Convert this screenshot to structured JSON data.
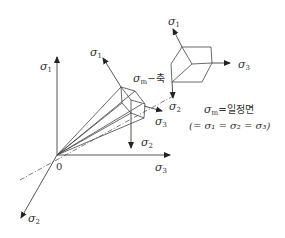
{
  "diagram": {
    "axes": {
      "sigma1": {
        "symbol": "σ",
        "sub": "1"
      },
      "sigma2": {
        "symbol": "σ",
        "sub": "2"
      },
      "sigma3": {
        "symbol": "σ",
        "sub": "3"
      },
      "origin": "0"
    },
    "hydrostatic_axis_label": {
      "symbol": "σ",
      "sub": "m",
      "suffix": "−축"
    },
    "plane_label": {
      "line1": {
        "symbol": "σ",
        "sub": "m",
        "suffix": "=일정면"
      },
      "line2": "(= σ₁ = σ₂ = σ₃)"
    },
    "colors": {
      "line": "#444444",
      "text": "#333333",
      "background": "#ffffff"
    }
  }
}
